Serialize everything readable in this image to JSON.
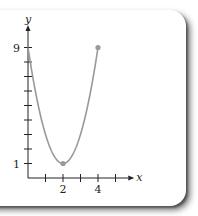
{
  "chart_data": {
    "type": "line",
    "title": "",
    "xlabel": "x",
    "ylabel": "y",
    "xlim": [
      0,
      5.5
    ],
    "ylim": [
      0,
      10
    ],
    "x_ticks": [
      1,
      2,
      3,
      4,
      5
    ],
    "x_tick_labels": [
      {
        "value": 2,
        "label": "2"
      },
      {
        "value": 4,
        "label": "4"
      }
    ],
    "y_ticks": [
      1,
      2,
      3,
      4,
      5,
      6,
      7,
      8,
      9
    ],
    "y_tick_labels": [
      {
        "value": 9,
        "label": "9"
      },
      {
        "value": 1,
        "label": "1"
      }
    ],
    "grid": false,
    "series": [
      {
        "name": "parabola",
        "function": "y = 2(x-2)^2 + 1",
        "x": [
          0,
          0.5,
          1,
          1.5,
          2,
          2.5,
          3,
          3.5,
          4
        ],
        "values": [
          9,
          5.5,
          3,
          1.5,
          1,
          1.5,
          3,
          5.5,
          9
        ],
        "color": "#999999"
      }
    ],
    "points": [
      {
        "name": "vertex",
        "x": 2,
        "y": 1
      },
      {
        "name": "endpoint",
        "x": 4,
        "y": 9
      }
    ],
    "colors": {
      "curve": "#999999",
      "axis": "#222222"
    }
  }
}
